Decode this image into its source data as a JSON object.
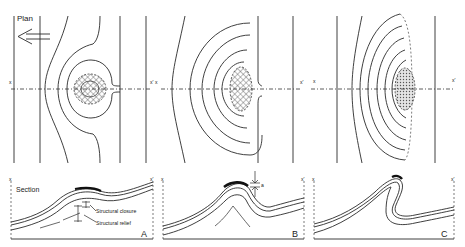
{
  "plan": {
    "title": "Plan",
    "arrow_direction": "west",
    "line_end_left": "x",
    "line_end_right": "x'"
  },
  "section": {
    "title": "Section",
    "line_end_left": "x",
    "line_end_right": "x'"
  },
  "panels": [
    {
      "id": "A",
      "label": "A",
      "annotations": [
        "Structural closure",
        "Structural relief"
      ]
    },
    {
      "id": "B",
      "label": "B",
      "annotations": [
        "a"
      ]
    },
    {
      "id": "C",
      "label": "C",
      "annotations": []
    }
  ]
}
